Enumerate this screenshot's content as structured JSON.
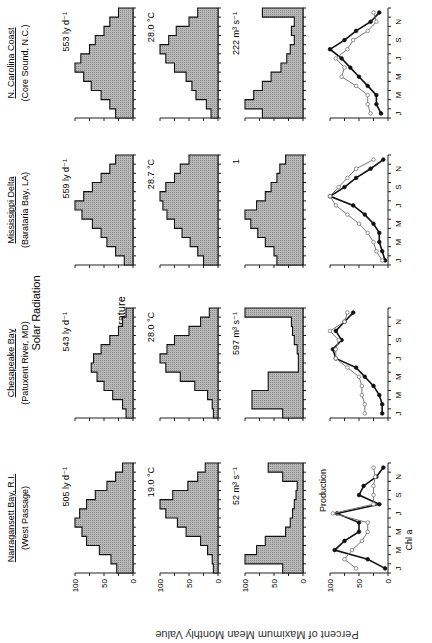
{
  "figure": {
    "ylabel": "Percent of Maximum Mean Monthly Value",
    "row_labels": [
      "Solar Radiation",
      "Water Temperature",
      "River Flow",
      ""
    ],
    "month_ticks": [
      "J",
      "M",
      "M",
      "J",
      "S",
      "N"
    ],
    "y_ticks": [
      "100",
      "50",
      "0"
    ],
    "annotations": {
      "production": "Production",
      "chla": "Chl a"
    }
  },
  "sites": [
    {
      "name": "Narragansett Bay, R.I.",
      "location": "(West Passage)",
      "solar_label": "505 ly d⁻¹",
      "temp_label": "19.0 °C",
      "flow_label": "52 m³ s⁻¹"
    },
    {
      "name": "Chesapeake Bay",
      "location": "(Patuxent River, MD)",
      "solar_label": "543 ly d⁻¹",
      "temp_label": "28.0 °C",
      "flow_label": "597 m³ s⁻¹"
    },
    {
      "name": "Mississippi Delta",
      "location": "(Barataria Bay, LA)",
      "solar_label": "559 ly d⁻¹",
      "temp_label": "28.7 °C",
      "flow_label": "1"
    },
    {
      "name": "N. Carolina Coast",
      "location": "(Core Sound, N.C.)",
      "solar_label": "553 ly d⁻¹",
      "temp_label": "28.0 °C",
      "flow_label": "222 m³ s⁻¹"
    }
  ],
  "colors": {
    "fill": "#b8b8b8",
    "line": "#111111",
    "open_marker": "#777777"
  },
  "chart_data": {
    "type": "bar",
    "title": "",
    "xlabel": "Month",
    "ylabel": "Percent of Maximum Mean Monthly Value",
    "ylim": [
      0,
      100
    ],
    "categories": [
      "J",
      "F",
      "M",
      "A",
      "M",
      "J",
      "J",
      "A",
      "S",
      "O",
      "N",
      "D"
    ],
    "panels": [
      {
        "site": "Narragansett Bay, R.I.",
        "variable": "Solar Radiation",
        "max_label": "505 ly d-1",
        "values": [
          28,
          38,
          58,
          80,
          88,
          100,
          92,
          80,
          65,
          45,
          30,
          18
        ]
      },
      {
        "site": "Narragansett Bay, R.I.",
        "variable": "Water Temperature",
        "max_label": "19.0 C",
        "values": [
          8,
          10,
          18,
          30,
          55,
          70,
          90,
          100,
          78,
          52,
          35,
          22
        ]
      },
      {
        "site": "Narragansett Bay, R.I.",
        "variable": "River Flow",
        "max_label": "52 m3 s-1",
        "values": [
          35,
          100,
          80,
          65,
          30,
          22,
          18,
          15,
          12,
          10,
          35,
          60
        ]
      },
      {
        "site": "Narragansett Bay, R.I.",
        "variable": "Production / Chl a",
        "type": "line",
        "series": [
          {
            "name": "Production",
            "values": [
              5,
              35,
              92,
              75,
              50,
              50,
              88,
              15,
              50,
              42,
              20,
              8
            ]
          },
          {
            "name": "Chl a",
            "values": [
              55,
              75,
              62,
              45,
              35,
              35,
              95,
              25,
              25,
              25,
              22,
              25
            ]
          }
        ]
      },
      {
        "site": "Chesapeake Bay",
        "variable": "Solar Radiation",
        "max_label": "543 ly d-1",
        "values": [
          12,
          18,
          35,
          50,
          62,
          72,
          68,
          55,
          40,
          25,
          18,
          12
        ]
      },
      {
        "site": "Chesapeake Bay",
        "variable": "Water Temperature",
        "max_label": "28.0 C",
        "values": [
          8,
          10,
          18,
          40,
          65,
          90,
          100,
          88,
          75,
          50,
          30,
          15
        ]
      },
      {
        "site": "Chesapeake Bay",
        "variable": "River Flow",
        "max_label": "597 m3 s-1",
        "values": [
          35,
          88,
          88,
          60,
          60,
          8,
          8,
          10,
          15,
          18,
          20,
          100
        ]
      },
      {
        "site": "Chesapeake Bay",
        "variable": "Production / Chl a",
        "type": "line",
        "series": [
          {
            "name": "Production",
            "values": [
              10,
              10,
              15,
              25,
              40,
              55,
              90,
              95,
              80,
              90,
              75,
              60
            ]
          },
          {
            "name": "Chl a",
            "values": [
              40,
              40,
              45,
              45,
              50,
              70,
              90,
              90,
              85,
              100,
              75,
              70
            ]
          }
        ]
      },
      {
        "site": "Mississippi Delta",
        "variable": "Solar Radiation",
        "max_label": "559 ly d-1",
        "values": [
          15,
          30,
          45,
          55,
          70,
          88,
          100,
          85,
          70,
          55,
          40,
          30
        ]
      },
      {
        "site": "Mississippi Delta",
        "variable": "Water Temperature",
        "max_label": "28.7 C",
        "values": [
          25,
          35,
          48,
          62,
          75,
          88,
          95,
          100,
          90,
          75,
          65,
          50
        ]
      },
      {
        "site": "Mississippi Delta",
        "variable": "River Flow",
        "max_label": "1",
        "values": [
          45,
          50,
          65,
          78,
          90,
          100,
          80,
          65,
          55,
          45,
          40,
          30
        ]
      },
      {
        "site": "Mississippi Delta",
        "variable": "Production / Chl a",
        "type": "line",
        "series": [
          {
            "name": "Production",
            "values": [
              5,
              10,
              15,
              15,
              25,
              40,
              60,
              100,
              75,
              55,
              30,
              8
            ]
          },
          {
            "name": "Chl a",
            "values": [
              10,
              20,
              25,
              35,
              50,
              70,
              90,
              100,
              85,
              70,
              55,
              25
            ]
          }
        ]
      },
      {
        "site": "N. Carolina Coast",
        "variable": "Solar Radiation",
        "max_label": "553 ly d-1",
        "values": [
          30,
          40,
          55,
          72,
          85,
          100,
          90,
          75,
          65,
          50,
          40,
          25
        ]
      },
      {
        "site": "N. Carolina Coast",
        "variable": "Water Temperature",
        "max_label": "28.0 C",
        "values": [
          12,
          20,
          38,
          45,
          55,
          75,
          90,
          100,
          85,
          72,
          50,
          35
        ]
      },
      {
        "site": "N. Carolina Coast",
        "variable": "River Flow",
        "max_label": "222 m3 s-1",
        "values": [
          70,
          100,
          85,
          70,
          55,
          38,
          28,
          22,
          15,
          20,
          15,
          70
        ]
      },
      {
        "site": "N. Carolina Coast",
        "variable": "Production / Chl a",
        "type": "line",
        "series": [
          {
            "name": "Production",
            "values": [
              12,
              20,
              20,
              35,
              50,
              65,
              80,
              100,
              75,
              55,
              30,
              15
            ]
          },
          {
            "name": "Chl a",
            "values": [
              30,
              35,
              35,
              55,
              80,
              75,
              90,
              70,
              60,
              35,
              20,
              25
            ]
          }
        ]
      }
    ],
    "legend": [
      "Production",
      "Chl a"
    ],
    "grid": false
  }
}
